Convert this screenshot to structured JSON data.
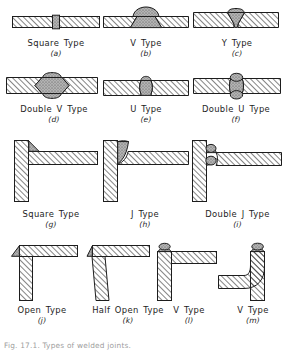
{
  "figure": {
    "caption": "Fig. 17.1.  Types of welded joints.",
    "colors": {
      "ink": "#1d1d1d",
      "plate_fill": "#ffffff",
      "hatch": "#2a2a2a",
      "bead_fill": "#9a9a9a",
      "paper": "#ffffff"
    }
  },
  "rows": [
    {
      "name": "butt-joints-row-1",
      "items": [
        {
          "key": "a",
          "label": "Square  Type",
          "sub": "(a)",
          "diagram": "butt-square"
        },
        {
          "key": "b",
          "label": "V  Type",
          "sub": "(b)",
          "diagram": "butt-v"
        },
        {
          "key": "c",
          "label": "Y  Type",
          "sub": "(c)",
          "diagram": "butt-y"
        }
      ]
    },
    {
      "name": "butt-joints-row-2",
      "items": [
        {
          "key": "d",
          "label": "Double  V  Type",
          "sub": "(d)",
          "diagram": "butt-double-v"
        },
        {
          "key": "e",
          "label": "U  Type",
          "sub": "(e)",
          "diagram": "butt-u"
        },
        {
          "key": "f",
          "label": "Double  U  Type",
          "sub": "(f)",
          "diagram": "butt-double-u"
        }
      ]
    },
    {
      "name": "tee-joints-row-3",
      "items": [
        {
          "key": "g",
          "label": "Square  Type",
          "sub": "(g)",
          "diagram": "tee-square"
        },
        {
          "key": "h",
          "label": "J  Type",
          "sub": "(h)",
          "diagram": "tee-j"
        },
        {
          "key": "i",
          "label": "Double  J  Type",
          "sub": "(i)",
          "diagram": "tee-double-j"
        }
      ]
    },
    {
      "name": "corner-joints-row-4",
      "items": [
        {
          "key": "j",
          "label": "Open  Type",
          "sub": "(j)",
          "diagram": "corner-open"
        },
        {
          "key": "k",
          "label": "Half  Open  Type",
          "sub": "(k)",
          "diagram": "corner-half-open"
        },
        {
          "key": "l",
          "label": "V  Type",
          "sub": "(l)",
          "diagram": "corner-v"
        },
        {
          "key": "m",
          "label": "V  Type",
          "sub": "(m)",
          "diagram": "corner-v-bent"
        }
      ]
    }
  ]
}
